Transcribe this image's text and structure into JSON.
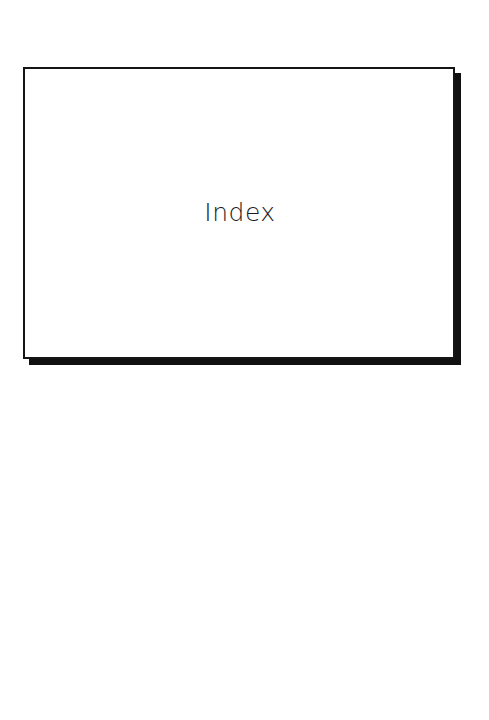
{
  "page": {
    "title_box": {
      "title": "Index"
    }
  },
  "colors": {
    "background": "#ffffff",
    "border": "#151515",
    "shadow": "#111111",
    "text": "#1a1a1a"
  }
}
